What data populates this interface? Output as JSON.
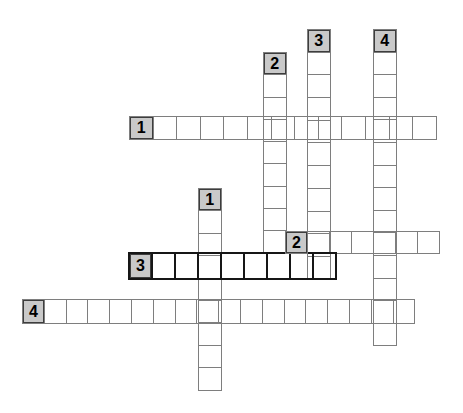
{
  "canvas": {
    "width": 463,
    "height": 413,
    "background": "#ffffff"
  },
  "puzzle": {
    "kind": "crossword-skeleton",
    "colors": {
      "cell_border": "#7e7e7e",
      "bold_word_border": "#161616",
      "numbered_cell_fill": "#c9c9c9",
      "numbered_cell_border": "#3d3d3d",
      "number_color": "#000000",
      "background": "#ffffff"
    },
    "words": [
      {
        "id": "down-2",
        "number": "2",
        "orientation": "down",
        "cells": 9,
        "x": 263,
        "y": 52,
        "cell_w": 23.5,
        "cell_h": 23.3,
        "bold": false
      },
      {
        "id": "down-3",
        "number": "3",
        "orientation": "down",
        "cells": 11,
        "x": 307,
        "y": 29,
        "cell_w": 23.5,
        "cell_h": 23.7,
        "bold": false
      },
      {
        "id": "down-4",
        "number": "4",
        "orientation": "down",
        "cells": 14,
        "x": 373,
        "y": 29,
        "cell_w": 23.5,
        "cell_h": 23.6,
        "bold": false
      },
      {
        "id": "down-1",
        "number": "1",
        "orientation": "down",
        "cells": 9,
        "x": 198,
        "y": 188,
        "cell_w": 23.5,
        "cell_h": 23.4,
        "bold": false
      },
      {
        "id": "across-1",
        "number": "1",
        "orientation": "across",
        "cells": 13,
        "x": 129,
        "y": 116,
        "cell_w": 24.6,
        "cell_h": 24,
        "bold": false
      },
      {
        "id": "across-2",
        "number": "2",
        "orientation": "across",
        "cells": 7,
        "x": 285,
        "y": 231,
        "cell_w": 23.0,
        "cell_h": 23,
        "bold": false
      },
      {
        "id": "across-3",
        "number": "3",
        "orientation": "across",
        "cells": 9,
        "x": 128,
        "y": 252,
        "cell_w": 25.0,
        "cell_h": 28,
        "bold": true
      },
      {
        "id": "across-4",
        "number": "4",
        "orientation": "across",
        "cells": 18,
        "x": 22,
        "y": 299,
        "cell_w": 22.8,
        "cell_h": 25,
        "bold": false
      }
    ]
  }
}
